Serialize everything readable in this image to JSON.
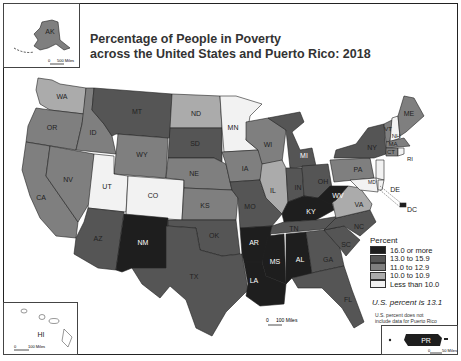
{
  "title": {
    "line1": "Percentage of People in Poverty",
    "line2": "across the United States and Puerto Rico: 2018"
  },
  "colors": {
    "c5": "#1e1e1e",
    "c4": "#555555",
    "c3": "#7f7f7f",
    "c2": "#ababab",
    "c1": "#f2f2f2",
    "border": "#222222"
  },
  "legend": {
    "title": "Percent",
    "items": [
      {
        "label": "16.0 or more",
        "color": "#1e1e1e"
      },
      {
        "label": "13.0 to 15.9",
        "color": "#555555"
      },
      {
        "label": "11.0 to 12.9",
        "color": "#7f7f7f"
      },
      {
        "label": "10.0 to 10.9",
        "color": "#ababab"
      },
      {
        "label": "Less than 10.0",
        "color": "#f2f2f2"
      }
    ]
  },
  "us_percent": "U.S. percent is 13.1",
  "note": {
    "line1": "U.S. percent does not",
    "line2": "include data for Puerto Rico"
  },
  "insets": {
    "alaska": {
      "label": "AK",
      "scale": "500 Miles",
      "zero": "0"
    },
    "hawaii": {
      "label": "HI",
      "scale": "100 Miles",
      "zero": "0"
    },
    "puerto_rico": {
      "label": "PR",
      "scale": "50 Miles",
      "zero": "0"
    }
  },
  "main_scale": {
    "zero": "0",
    "label": "100 Miles"
  },
  "states": {
    "WA": "WA",
    "OR": "OR",
    "CA": "CA",
    "ID": "ID",
    "NV": "NV",
    "MT": "MT",
    "WY": "WY",
    "UT": "UT",
    "CO": "CO",
    "AZ": "AZ",
    "NM": "NM",
    "ND": "ND",
    "SD": "SD",
    "NE": "NE",
    "KS": "KS",
    "OK": "OK",
    "TX": "TX",
    "MN": "MN",
    "IA": "IA",
    "MO": "MO",
    "AR": "AR",
    "LA": "LA",
    "WI": "WI",
    "IL": "IL",
    "MI": "MI",
    "IN": "IN",
    "OH": "OH",
    "KY": "KY",
    "TN": "TN",
    "MS": "MS",
    "AL": "AL",
    "GA": "GA",
    "FL": "FL",
    "SC": "SC",
    "NC": "NC",
    "VA": "VA",
    "WV": "WV",
    "PA": "PA",
    "NY": "NY",
    "VT": "VT",
    "NH": "NH",
    "ME": "ME",
    "MA": "MA",
    "CT": "CT",
    "RI": "RI",
    "NJ": "NJ",
    "DE": "DE",
    "MD": "MD",
    "DC": "DC"
  }
}
